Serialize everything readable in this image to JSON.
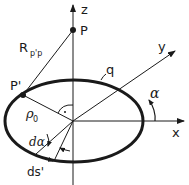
{
  "diagram": {
    "axes": {
      "z_label": "z",
      "y_label": "y",
      "x_label": "x"
    },
    "points": {
      "P_label": "P",
      "P_prime_label": "P'"
    },
    "labels": {
      "R_main": "R",
      "R_sub": "p'p",
      "q": "q",
      "alpha": "α",
      "rho_main": "ρ",
      "rho_sub": "0",
      "d_alpha": "dα",
      "ds": "ds'"
    },
    "colors": {
      "line": "#1a1a1a",
      "background": "#ffffff"
    }
  }
}
